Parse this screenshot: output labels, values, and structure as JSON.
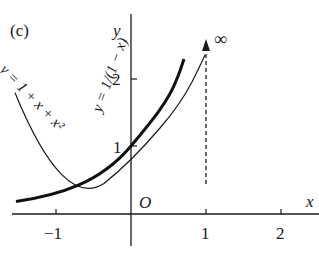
{
  "panel_label": "(c)",
  "axes": {
    "x_label": "x",
    "y_label": "y",
    "origin_label": "O",
    "x_ticks": [
      {
        "value": -1,
        "label": "−1",
        "px": 56
      },
      {
        "value": 1,
        "label": "1",
        "px": 206
      },
      {
        "value": 2,
        "label": "2",
        "px": 281
      }
    ],
    "y_ticks": [
      {
        "value": 1,
        "label": "1",
        "px": 146
      },
      {
        "value": 2,
        "label": "2",
        "px": 79
      }
    ]
  },
  "curves": [
    {
      "name": "geometric-series",
      "label": "y = 1/(1 − x)",
      "style": "thick"
    },
    {
      "name": "quadratic-approximation",
      "label": "y = 1 + x + x²",
      "style": "thin"
    }
  ],
  "annotation": {
    "symbol": "∞",
    "arrow": "dashed vertical arrow at x = 1"
  },
  "colors": {
    "ink": "#1a1a1a",
    "background": "#ffffff"
  }
}
